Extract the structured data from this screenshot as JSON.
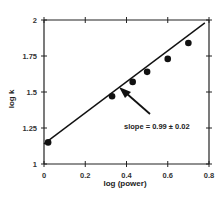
{
  "chart_data": {
    "type": "scatter",
    "title": "",
    "xlabel": "log (power)",
    "ylabel": "log k",
    "xlim": [
      0,
      0.8
    ],
    "ylim": [
      1,
      2
    ],
    "x_ticks": [
      "0",
      "0.2",
      "0.4",
      "0.6",
      "0.8"
    ],
    "y_ticks": [
      "1",
      "1.25",
      "1.5",
      "1.75",
      "2"
    ],
    "grid": false,
    "legend": null,
    "series": [
      {
        "name": "data",
        "marker": "filled-circle",
        "x": [
          0.02,
          0.33,
          0.43,
          0.5,
          0.6,
          0.7
        ],
        "y": [
          1.15,
          1.47,
          1.57,
          1.64,
          1.73,
          1.84
        ]
      }
    ],
    "fit_line": {
      "type": "linear",
      "x": [
        0.0,
        0.78
      ],
      "y": [
        1.14,
        1.98
      ],
      "slope": 0.99,
      "slope_error": 0.02
    },
    "annotations": [
      {
        "text": "slope = 0.99 ± 0.02",
        "arrow_to_x": 0.38,
        "arrow_to_y": 1.5
      }
    ],
    "colors": {
      "axis": "#222222",
      "points": "#111111",
      "line": "#111111"
    }
  }
}
